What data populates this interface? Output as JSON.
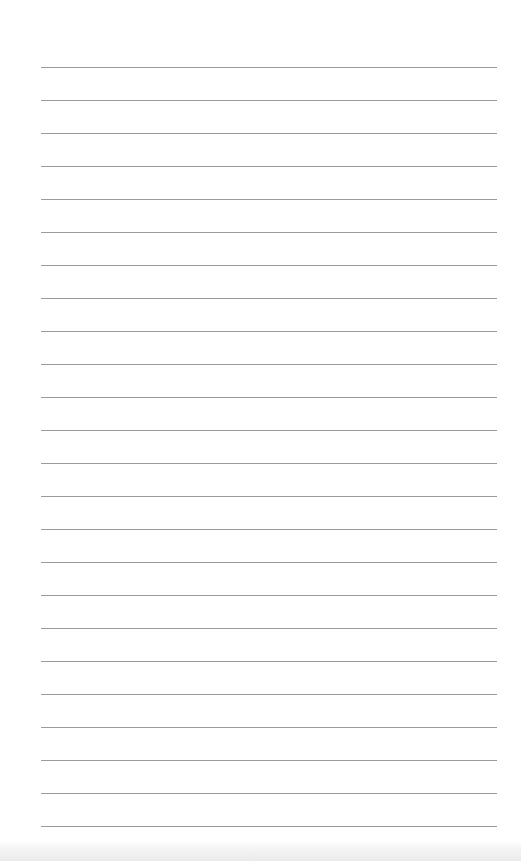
{
  "document": {
    "type": "lined-paper",
    "line_count": 24,
    "first_line_y": 67,
    "line_spacing": 33,
    "line_left": 41,
    "line_width": 456,
    "line_color": "#9a9a9a",
    "background_color": "#ffffff"
  }
}
